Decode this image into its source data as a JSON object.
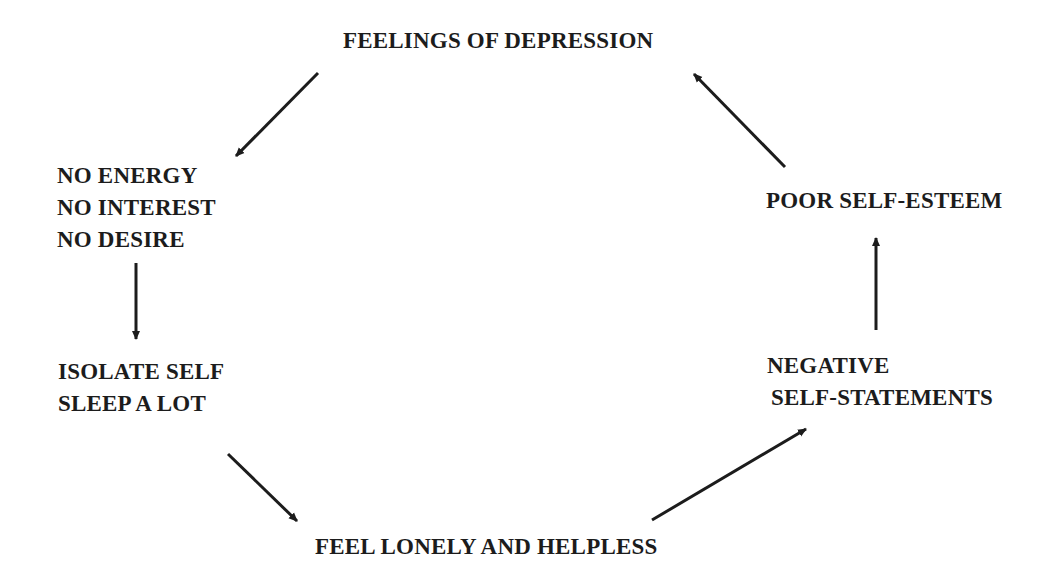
{
  "diagram": {
    "type": "cycle",
    "ink_color": "#1c1c1c",
    "background": "#ffffff",
    "nodes": {
      "depression": {
        "lines": [
          "FEELINGS OF DEPRESSION"
        ]
      },
      "no_energy": {
        "lines": [
          "NO ENERGY",
          "NO INTEREST",
          "NO DESIRE"
        ]
      },
      "isolate": {
        "lines": [
          "ISOLATE SELF",
          "SLEEP A LOT"
        ]
      },
      "lonely": {
        "lines": [
          "FEEL LONELY AND HELPLESS"
        ]
      },
      "negative": {
        "lines": [
          "NEGATIVE",
          "SELF-STATEMENTS"
        ]
      },
      "esteem": {
        "lines": [
          "POOR SELF-ESTEEM"
        ]
      }
    },
    "edges": [
      {
        "from": "FEELINGS OF DEPRESSION",
        "to": "NO ENERGY / NO INTEREST / NO DESIRE"
      },
      {
        "from": "NO ENERGY / NO INTEREST / NO DESIRE",
        "to": "ISOLATE SELF / SLEEP A LOT"
      },
      {
        "from": "ISOLATE SELF / SLEEP A LOT",
        "to": "FEEL LONELY AND HELPLESS"
      },
      {
        "from": "FEEL LONELY AND HELPLESS",
        "to": "NEGATIVE SELF-STATEMENTS"
      },
      {
        "from": "NEGATIVE SELF-STATEMENTS",
        "to": "POOR SELF-ESTEEM"
      },
      {
        "from": "POOR SELF-ESTEEM",
        "to": "FEELINGS OF DEPRESSION"
      }
    ]
  }
}
